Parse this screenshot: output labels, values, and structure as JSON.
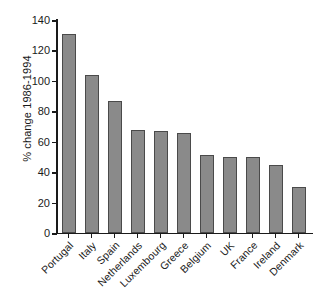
{
  "chart_data": {
    "type": "bar",
    "title": "",
    "subtitle": "",
    "xlabel": "",
    "ylabel": "% change 1986-1994",
    "categories": [
      "Portugal",
      "Italy",
      "Spain",
      "Netherlands",
      "Luxembourg",
      "Greece",
      "Belgium",
      "UK",
      "France",
      "Ireland",
      "Denmark"
    ],
    "values": [
      131,
      104,
      87,
      68,
      67,
      66,
      51,
      50,
      50,
      44.5,
      30
    ],
    "ylim": [
      0,
      140
    ],
    "yticks": [
      0,
      20,
      40,
      60,
      80,
      100,
      120,
      140
    ],
    "ytick_labels": [
      "0",
      "20",
      "40",
      "60",
      "80",
      "100",
      "120",
      "140"
    ],
    "grid": false,
    "legend": false,
    "legend_position": "none",
    "bar_color": "#8a8a8a",
    "bar_edge_color": "#4a4a4a",
    "axis_color": "#1a1a1a",
    "background_color": "#ffffff",
    "xtick_label_rotation": 45,
    "spines": [
      "left",
      "bottom"
    ]
  }
}
